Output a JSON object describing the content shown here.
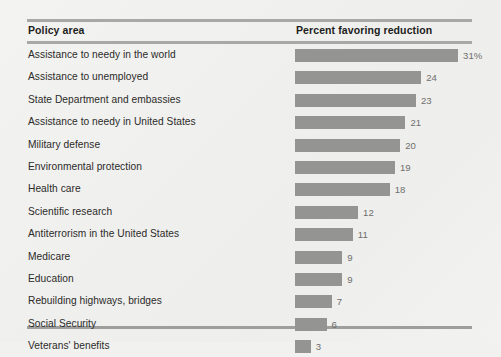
{
  "header": {
    "policy_label": "Policy area",
    "percent_label": "Percent favoring reduction"
  },
  "style": {
    "bar_color": "#949492",
    "rule_color": "#a8a8a6",
    "background_color": "#f1f1ef",
    "label_color": "#2b2b29",
    "value_color": "#6e6e6c"
  },
  "chart_data": {
    "type": "bar",
    "orientation": "horizontal",
    "title": "",
    "xlabel": "Percent favoring reduction",
    "ylabel": "Policy area",
    "xlim": [
      0,
      31
    ],
    "grid": false,
    "legend": false,
    "categories": [
      "Assistance to needy in the world",
      "Assistance to unemployed",
      "State Department and embassies",
      "Assistance to needy in United States",
      "Military defense",
      "Environmental protection",
      "Health care",
      "Scientific research",
      "Antiterrorism in the United States",
      "Medicare",
      "Education",
      "Rebuilding highways, bridges",
      "Social Security",
      "Veterans' benefits"
    ],
    "values": [
      31,
      24,
      23,
      21,
      20,
      19,
      18,
      12,
      11,
      9,
      9,
      7,
      6,
      3
    ],
    "value_labels": [
      "31%",
      "24",
      "23",
      "21",
      "20",
      "19",
      "18",
      "12",
      "11",
      "9",
      "9",
      "7",
      "6",
      "3"
    ],
    "rows": [
      {
        "label": "Assistance to needy in the world",
        "value": 31,
        "value_label": "31%"
      },
      {
        "label": "Assistance to unemployed",
        "value": 24,
        "value_label": "24"
      },
      {
        "label": "State Department and embassies",
        "value": 23,
        "value_label": "23"
      },
      {
        "label": "Assistance to needy in United States",
        "value": 21,
        "value_label": "21"
      },
      {
        "label": "Military defense",
        "value": 20,
        "value_label": "20"
      },
      {
        "label": "Environmental protection",
        "value": 19,
        "value_label": "19"
      },
      {
        "label": "Health care",
        "value": 18,
        "value_label": "18"
      },
      {
        "label": "Scientific research",
        "value": 12,
        "value_label": "12"
      },
      {
        "label": "Antiterrorism in the United States",
        "value": 11,
        "value_label": "11"
      },
      {
        "label": "Medicare",
        "value": 9,
        "value_label": "9"
      },
      {
        "label": "Education",
        "value": 9,
        "value_label": "9"
      },
      {
        "label": "Rebuilding highways, bridges",
        "value": 7,
        "value_label": "7"
      },
      {
        "label": "Social Security",
        "value": 6,
        "value_label": "6"
      },
      {
        "label": "Veterans' benefits",
        "value": 3,
        "value_label": "3"
      }
    ]
  }
}
